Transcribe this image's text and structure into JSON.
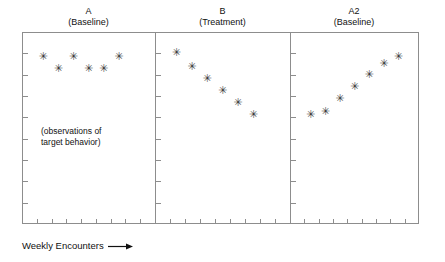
{
  "figure": {
    "axis_caption": "Weekly Encounters",
    "axis_caption_arrow": "arrow-right-icon",
    "annotation_line1": "(observations of",
    "annotation_line2": "target behavior)",
    "frame_color": "#8d8d8d",
    "marker_color": "#3a3a3a",
    "marker_glyph": "✳"
  },
  "panels": [
    {
      "phase": "A",
      "condition": "(Baseline)"
    },
    {
      "phase": "B",
      "condition": "(Treatment)"
    },
    {
      "phase": "A2",
      "condition": "(Baseline)"
    }
  ],
  "chart_data": {
    "type": "scatter",
    "title": "",
    "xlabel": "Weekly Encounters",
    "ylabel": "(observations of target behavior)",
    "grid": false,
    "legend": "none",
    "annotations": [
      "(observations of target behavior)"
    ],
    "xlim": [
      0,
      8
    ],
    "ylim": [
      0,
      8
    ],
    "x_tick_count_per_panel": 8,
    "y_tick_count_per_panel": 8,
    "panels": [
      {
        "name": "A",
        "condition": "(Baseline)",
        "x": [
          1,
          2,
          3,
          4,
          5,
          6
        ],
        "y": [
          7.0,
          6.5,
          7.0,
          6.5,
          6.5,
          7.0
        ]
      },
      {
        "name": "B",
        "condition": "(Treatment)",
        "x": [
          1,
          2,
          3,
          4,
          5,
          6
        ],
        "y": [
          7.15,
          6.6,
          6.1,
          5.6,
          5.1,
          4.6
        ]
      },
      {
        "name": "A2",
        "condition": "(Baseline)",
        "x": [
          1,
          2,
          3,
          4,
          5,
          6,
          7
        ],
        "y": [
          4.6,
          4.7,
          5.25,
          5.75,
          6.25,
          6.7,
          7.0
        ]
      }
    ]
  }
}
